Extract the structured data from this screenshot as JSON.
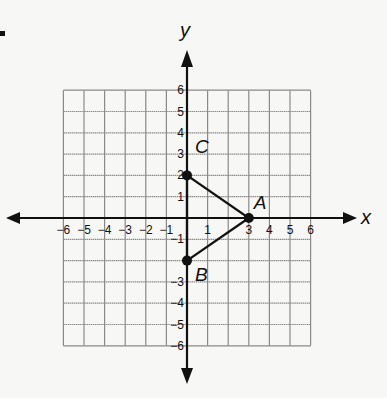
{
  "graph": {
    "x_axis_label": "x",
    "y_axis_label": "y",
    "x_range": [
      -6,
      6
    ],
    "y_range": [
      -6,
      6
    ],
    "x_ticks": [
      "-6",
      "-5",
      "-4",
      "-3",
      "-2",
      "-1",
      "1",
      "3",
      "4",
      "5",
      "6"
    ],
    "y_ticks": [
      "6",
      "5",
      "4",
      "3",
      "2",
      "1",
      "-1",
      "-3",
      "-4",
      "-5",
      "-6"
    ],
    "points": [
      {
        "label": "A",
        "x": 3,
        "y": 0
      },
      {
        "label": "B",
        "x": 0,
        "y": -2
      },
      {
        "label": "C",
        "x": 0,
        "y": 2
      }
    ],
    "triangle": [
      "A",
      "B",
      "C"
    ],
    "colors": {
      "grid": "#8a8a8a",
      "axis": "#111111",
      "background": "#f7f7f5"
    }
  }
}
